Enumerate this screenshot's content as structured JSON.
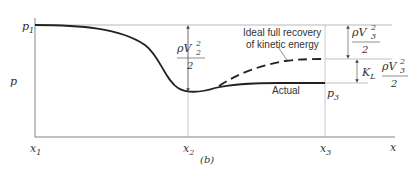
{
  "diagram": {
    "caption": "(b)",
    "y_axis_label": "p",
    "x_axis_label": "x",
    "labels": {
      "p1": "p",
      "p1_sub": "1",
      "p3": "p",
      "p3_sub": "3",
      "x1": "x",
      "x1_sub": "1",
      "x2": "x",
      "x2_sub": "2",
      "x3": "x",
      "x3_sub": "3"
    },
    "annotations": {
      "ideal_line1": "Ideal full recovery",
      "ideal_line2": "of kinetic energy",
      "actual": "Actual",
      "dyn_v2_num": "ρV",
      "dyn_v2_sup": "2",
      "dyn_v2_sub": "2",
      "dyn_v2_den": "2",
      "dyn_v3_num": "ρV",
      "dyn_v3_sup": "2",
      "dyn_v3_sub": "3",
      "dyn_v3_den": "2",
      "kl": "K",
      "kl_sub": "L",
      "kl_num": "ρV",
      "kl_sup": "2",
      "kl_sub3": "3",
      "kl_den": "2"
    },
    "colors": {
      "curve": "#222222",
      "axis": "#555555",
      "guide": "#888888",
      "text": "#333333"
    }
  }
}
